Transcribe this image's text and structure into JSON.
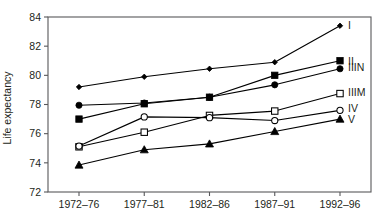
{
  "chart_data": {
    "type": "line",
    "title": "",
    "xlabel": "",
    "ylabel": "Life expectancy",
    "categories": [
      "1972–76",
      "1977–81",
      "1982–86",
      "1987–91",
      "1992–96"
    ],
    "ylim": [
      72,
      84
    ],
    "yticks": [
      72,
      74,
      76,
      78,
      80,
      82,
      84
    ],
    "ytick_labels": [
      "72",
      "74",
      "76",
      "78",
      "80",
      "82",
      "84"
    ],
    "grid": false,
    "legend_position": "right-inline-at-last-point",
    "series": [
      {
        "name": "I",
        "marker": "filled-diamond",
        "color": "#000000",
        "values": [
          79.2,
          79.9,
          80.45,
          80.9,
          83.4
        ]
      },
      {
        "name": "II",
        "marker": "filled-square",
        "color": "#000000",
        "values": [
          77.0,
          78.05,
          78.5,
          80.0,
          81.0
        ]
      },
      {
        "name": "IIIN",
        "marker": "filled-circle",
        "color": "#000000",
        "values": [
          77.95,
          78.1,
          78.5,
          79.35,
          80.45
        ]
      },
      {
        "name": "IIIM",
        "marker": "open-square",
        "color": "#000000",
        "values": [
          75.1,
          76.1,
          77.25,
          77.55,
          78.75
        ]
      },
      {
        "name": "IV",
        "marker": "open-circle",
        "color": "#000000",
        "values": [
          75.15,
          77.15,
          77.1,
          76.9,
          77.6
        ]
      },
      {
        "name": "V",
        "marker": "filled-triangle",
        "color": "#000000",
        "values": [
          73.85,
          74.9,
          75.3,
          76.15,
          77.0
        ]
      }
    ],
    "legend_label_offsets": {
      "I": 0,
      "II": -0.15,
      "IIIN": 0.1,
      "IIIM": 0,
      "IV": 0.15,
      "V": -0.2
    }
  },
  "plot": {
    "frame_color": "#58585a",
    "axis_color": "#58585a",
    "background": "#ffffff"
  }
}
